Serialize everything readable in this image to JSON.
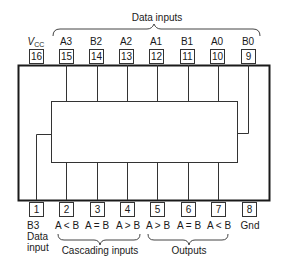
{
  "diagram": {
    "type": "ic-pinout",
    "top_group_label": "Data inputs",
    "bottom_groups": [
      {
        "label": "Cascading inputs"
      },
      {
        "label": "Outputs"
      }
    ],
    "top_pins": [
      {
        "number": "16",
        "name": "V",
        "name_sub": "CC"
      },
      {
        "number": "15",
        "name": "A3"
      },
      {
        "number": "14",
        "name": "B2"
      },
      {
        "number": "13",
        "name": "A2"
      },
      {
        "number": "12",
        "name": "A1"
      },
      {
        "number": "11",
        "name": "B1"
      },
      {
        "number": "10",
        "name": "A0"
      },
      {
        "number": "9",
        "name": "B0"
      }
    ],
    "bottom_pins": [
      {
        "number": "1",
        "name": "B3",
        "name2": "Data",
        "name3": "input"
      },
      {
        "number": "2",
        "name": "A < B"
      },
      {
        "number": "3",
        "name": "A = B"
      },
      {
        "number": "4",
        "name": "A > B"
      },
      {
        "number": "5",
        "name": "A > B"
      },
      {
        "number": "6",
        "name": "A = B"
      },
      {
        "number": "7",
        "name": "A < B"
      },
      {
        "number": "8",
        "name": "Gnd"
      }
    ],
    "colors": {
      "line": "#1a1a1a",
      "background": "#ffffff"
    }
  }
}
